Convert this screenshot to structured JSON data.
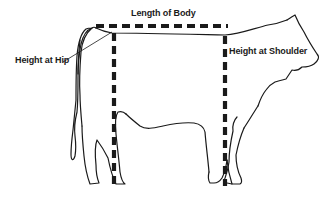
{
  "diagram": {
    "labels": {
      "length": "Length of Body",
      "hip": "Height at Hip",
      "shoulder": "Height at Shoulder"
    },
    "colors": {
      "outline": "#1a1a1a",
      "measure_line": "#1a1a1a",
      "background": "#ffffff"
    }
  }
}
